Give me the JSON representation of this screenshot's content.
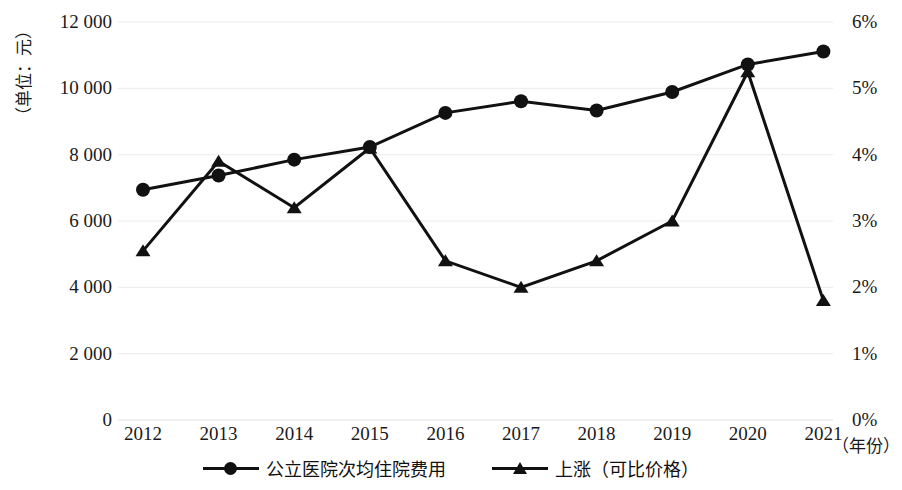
{
  "chart_data": {
    "type": "line",
    "title": "",
    "xlabel": "（年份）",
    "ylabel": "（单位：元）",
    "ylabel_right": "",
    "categories": [
      "2012",
      "2013",
      "2014",
      "2015",
      "2016",
      "2017",
      "2018",
      "2019",
      "2020",
      "2021"
    ],
    "ylim": [
      0,
      12000
    ],
    "yticks": [
      "0",
      "2 000",
      "4 000",
      "6 000",
      "8 000",
      "10 000",
      "12 000"
    ],
    "ytick_values": [
      0,
      2000,
      4000,
      6000,
      8000,
      10000,
      12000
    ],
    "ylim_right": [
      0,
      6
    ],
    "yticks_right": [
      "0%",
      "1%",
      "2%",
      "3%",
      "4%",
      "5%",
      "6%"
    ],
    "ytick_values_right": [
      0,
      1,
      2,
      3,
      4,
      5,
      6
    ],
    "grid": true,
    "legend_position": "bottom",
    "series": [
      {
        "name": "公立医院次均住院费用",
        "axis": "left",
        "marker": "circle",
        "unit": "元",
        "values": [
          6940,
          7370,
          7850,
          8230,
          9260,
          9610,
          9330,
          9890,
          10720,
          11110
        ]
      },
      {
        "name": "上涨（可比价格）",
        "axis": "right",
        "marker": "triangle",
        "unit": "%",
        "values": [
          2.55,
          3.9,
          3.2,
          4.1,
          2.4,
          2.0,
          2.4,
          3.0,
          5.25,
          1.8
        ]
      }
    ]
  },
  "legend": {
    "items": [
      {
        "label": "公立医院次均住院费用",
        "marker": "circle"
      },
      {
        "label": "上涨（可比价格）",
        "marker": "triangle"
      }
    ]
  },
  "colors": {
    "series": "#111111",
    "grid": "#ebebeb",
    "text": "#1a1a1a",
    "background": "#ffffff"
  }
}
